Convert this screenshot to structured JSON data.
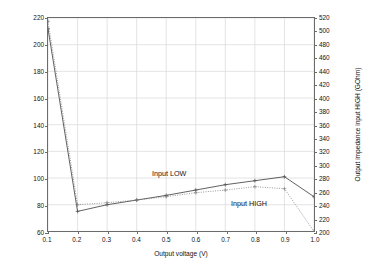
{
  "chart_data": {
    "type": "line",
    "title": "",
    "xlabel": "Output voltage (V)",
    "ylabel": "Output impedance input LOW (GOhm)",
    "ylabel_right": "Output impedance input HIGH (GOhm)",
    "xlim": [
      0.1,
      1.0
    ],
    "ylim": [
      60,
      220
    ],
    "ylim_right": [
      200,
      520
    ],
    "grid": true,
    "legend_position": "inline-annotation",
    "x": [
      0.1,
      0.2,
      0.3,
      0.4,
      0.5,
      0.6,
      0.7,
      0.8,
      0.9,
      1.0
    ],
    "xticks": [
      "0.1",
      "0.2",
      "0.3",
      "0.4",
      "0.5",
      "0.6",
      "0.7",
      "0.8",
      "0.9",
      "1.0"
    ],
    "yticks_left": [
      "60",
      "80",
      "100",
      "120",
      "140",
      "160",
      "180",
      "200",
      "220"
    ],
    "yticks_right": [
      "200",
      "220",
      "240",
      "260",
      "280",
      "300",
      "320",
      "340",
      "360",
      "380",
      "400",
      "420",
      "440",
      "460",
      "480",
      "500",
      "520"
    ],
    "series": [
      {
        "name": "Input LOW",
        "axis": "left",
        "style": "solid",
        "marker": "plus",
        "color": "#4d4d4d",
        "values": [
          212,
          75,
          80,
          83.5,
          87,
          91,
          95,
          98,
          101,
          86
        ]
      },
      {
        "name": "Input HIGH",
        "axis": "right",
        "style": "dotted",
        "marker": "plus",
        "color": "#808080",
        "values": [
          515,
          240,
          243,
          247,
          252,
          258,
          262,
          267,
          264,
          200
        ]
      }
    ],
    "annotations": [
      {
        "text": "Input LOW",
        "x": 0.55,
        "y": 104
      },
      {
        "text": "Input HIGH",
        "x": 0.82,
        "y": 76
      }
    ]
  }
}
